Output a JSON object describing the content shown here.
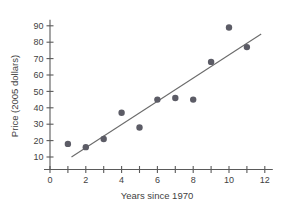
{
  "chart_data": {
    "type": "scatter",
    "title": "",
    "xlabel": "Years since 1970",
    "ylabel": "Price (2005 dollars)",
    "xlim": [
      0,
      12
    ],
    "ylim": [
      0,
      95
    ],
    "grid": false,
    "legend": null,
    "x_ticks": [
      0,
      1,
      2,
      3,
      4,
      5,
      6,
      7,
      8,
      9,
      10,
      11,
      12
    ],
    "x_tick_labels": [
      "0",
      "",
      "2",
      "",
      "4",
      "",
      "6",
      "",
      "8",
      "",
      "10",
      "",
      "12"
    ],
    "y_ticks": [
      10,
      20,
      30,
      40,
      50,
      60,
      70,
      80,
      90
    ],
    "y_tick_labels": [
      "10",
      "20",
      "30",
      "40",
      "50",
      "60",
      "70",
      "80",
      "90"
    ],
    "x": [
      1,
      2,
      3,
      4,
      5,
      6,
      7,
      8,
      9,
      10,
      11
    ],
    "y": [
      18,
      16,
      21,
      37,
      28,
      45,
      46,
      45,
      68,
      89,
      77
    ],
    "points": [
      {
        "x": 1,
        "y": 18
      },
      {
        "x": 2,
        "y": 16
      },
      {
        "x": 3,
        "y": 21
      },
      {
        "x": 4,
        "y": 37
      },
      {
        "x": 5,
        "y": 28
      },
      {
        "x": 6,
        "y": 45
      },
      {
        "x": 7,
        "y": 46
      },
      {
        "x": 8,
        "y": 45
      },
      {
        "x": 9,
        "y": 68
      },
      {
        "x": 10,
        "y": 89
      },
      {
        "x": 11,
        "y": 77
      }
    ],
    "trend_line": {
      "type": "linear-fit",
      "x_start": 1.2,
      "y_start": 10,
      "x_end": 11.8,
      "y_end": 85
    },
    "marker": {
      "shape": "circle",
      "size_px": 3.2,
      "color": "#5c5c66"
    },
    "colors": {
      "point": "#5c5c66",
      "trend": "#6b6b6b",
      "axis": "#5a5a5a",
      "text": "#3f3f3f",
      "background": "#ffffff"
    }
  }
}
